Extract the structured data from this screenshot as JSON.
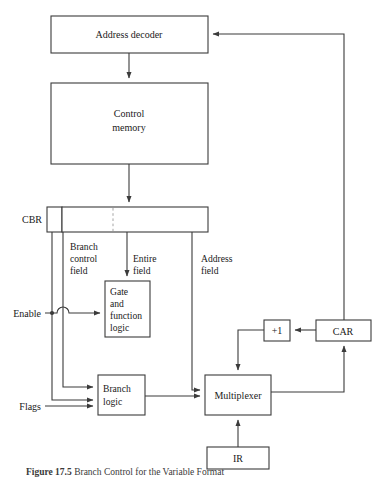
{
  "figure": {
    "caption_number": "Figure 17.5",
    "caption_text": "Branch Control for the Variable Format",
    "caption_full": "Figure 17.5   Branch Control for the Variable Format"
  },
  "blocks": {
    "address_decoder": "Address decoder",
    "control_memory_line1": "Control",
    "control_memory_line2": "memory",
    "cbr": "CBR",
    "gate_logic_line1": "Gate",
    "gate_logic_line2": "and",
    "gate_logic_line3": "function",
    "gate_logic_line4": "logic",
    "branch_logic_line1": "Branch",
    "branch_logic_line2": "logic",
    "multiplexer": "Multiplexer",
    "ir": "IR",
    "car": "CAR",
    "incrementer": "+1"
  },
  "field_labels": {
    "branch_control_line1": "Branch",
    "branch_control_line2": "control",
    "branch_control_line3": "field",
    "entire_line1": "Entire",
    "entire_line2": "field",
    "address_line1": "Address",
    "address_line2": "field"
  },
  "signals": {
    "enable": "Enable",
    "flags": "Flags"
  },
  "colors": {
    "stroke": "#3b3b3b",
    "box_fill": "#ffffff",
    "text": "#1a1a1a",
    "dashed": "#9a9a9a",
    "background": "#ffffff"
  }
}
